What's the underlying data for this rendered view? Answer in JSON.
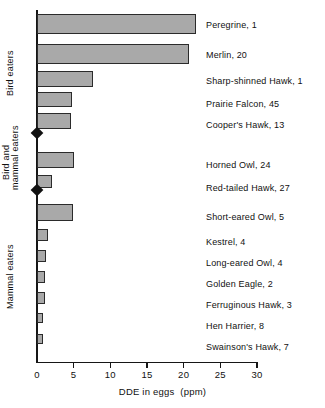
{
  "chart_data": {
    "type": "bar",
    "orientation": "horizontal",
    "title": "",
    "xlabel": "DDE in eggs (ppm)",
    "ylabel": "",
    "xlim": [
      0,
      30
    ],
    "xticks": [
      0,
      5,
      10,
      15,
      20,
      25,
      30
    ],
    "grid": false,
    "legend": false,
    "bar_fill_color": "#a9a9a9",
    "bar_edge_color": "#2b2b2b",
    "categories": [
      "Peregrine",
      "Merlin",
      "Sharp-shinned Hawk",
      "Prairie Falcon",
      "Cooper's Hawk",
      "Horned Owl",
      "Red-tailed Hawk",
      "Short-eared Owl",
      "Kestrel",
      "Long-eared Owl",
      "Golden Eagle",
      "Ferruginous Hawk",
      "Hen Harrier",
      "Swainson's Hawk"
    ],
    "values": [
      21.7,
      20.7,
      7.6,
      4.8,
      4.6,
      5.1,
      2.0,
      4.9,
      1.5,
      1.2,
      1.1,
      1.1,
      0.8,
      0.8
    ],
    "sample_sizes": [
      1,
      20,
      1,
      45,
      13,
      24,
      27,
      5,
      4,
      4,
      2,
      3,
      8,
      7
    ],
    "groups": [
      {
        "label": "Bird eaters",
        "rows": [
          0,
          1,
          2,
          3,
          4
        ]
      },
      {
        "label": "Bird and\nmammal eaters",
        "rows": [
          5,
          6
        ]
      },
      {
        "label": "Mammal eaters",
        "rows": [
          7,
          8,
          9,
          10,
          11,
          12,
          13
        ]
      }
    ]
  },
  "rows": [
    {
      "label": "Peregrine,  1",
      "value": 21.7
    },
    {
      "label": "Merlin,  20",
      "value": 20.7
    },
    {
      "label": "Sharp-shinned Hawk,  1",
      "value": 7.6
    },
    {
      "label": "Prairie Falcon,  45",
      "value": 4.8
    },
    {
      "label": "Cooper's Hawk,  13",
      "value": 4.6
    },
    {
      "label": "Horned Owl,  24",
      "value": 5.1
    },
    {
      "label": "Red-tailed Hawk,  27",
      "value": 2.0
    },
    {
      "label": "Short-eared Owl,  5",
      "value": 4.9
    },
    {
      "label": "Kestrel,  4",
      "value": 1.5
    },
    {
      "label": "Long-eared Owl,  4",
      "value": 1.2
    },
    {
      "label": "Golden Eagle,  2",
      "value": 1.1
    },
    {
      "label": "Ferruginous Hawk,  3",
      "value": 1.1
    },
    {
      "label": "Hen Harrier,  8",
      "value": 0.8
    },
    {
      "label": "Swainson's Hawk,  7",
      "value": 0.8
    }
  ],
  "group_labels": {
    "bird_eaters": "Bird eaters",
    "bird_and_mammal_eaters_line1": "Bird and",
    "bird_and_mammal_eaters_line2": "mammal eaters",
    "mammal_eaters": "Mammal eaters"
  },
  "axis": {
    "x_title": "DDE in eggs",
    "x_title_units": "(ppm)",
    "x_ticks": [
      "0",
      "5",
      "10",
      "15",
      "20",
      "25",
      "30"
    ]
  }
}
